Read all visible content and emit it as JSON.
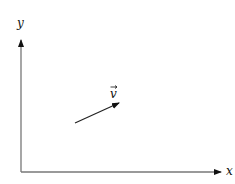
{
  "diagram": {
    "axes": {
      "x_label": "x",
      "y_label": "y",
      "color": "#777777"
    },
    "vector": {
      "label": "v",
      "has_arrow_accent": true,
      "color": "#222222"
    }
  }
}
